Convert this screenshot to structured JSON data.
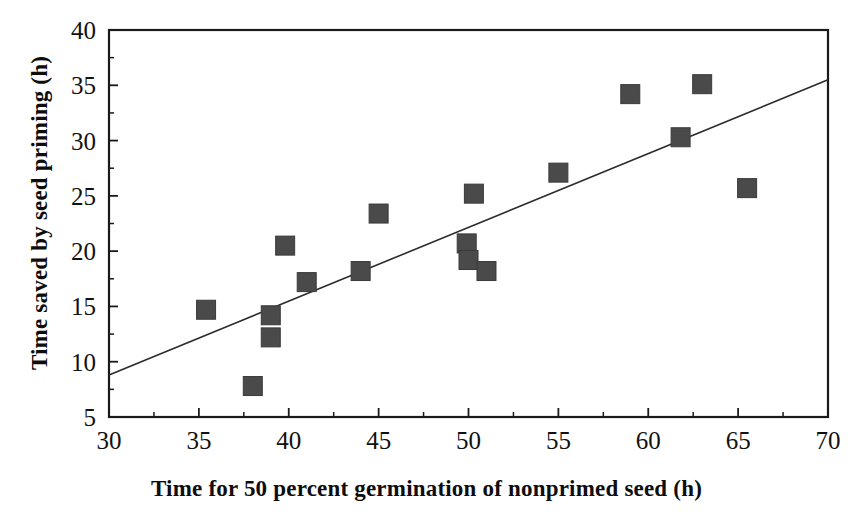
{
  "chart_data": {
    "type": "scatter",
    "title": "",
    "xlabel": "Time for 50 percent germination of nonprimed seed (h)",
    "ylabel": "Time saved by seed priming (h)",
    "xlim": [
      30,
      70
    ],
    "ylim": [
      5,
      40
    ],
    "x_major_ticks": [
      30,
      35,
      40,
      45,
      50,
      55,
      60,
      65,
      70
    ],
    "y_major_ticks": [
      5,
      10,
      15,
      20,
      25,
      30,
      35,
      40
    ],
    "x_minor_ticks": [
      32.5,
      37.5,
      42.5,
      47.5,
      52.5,
      57.5,
      62.5,
      67.5
    ],
    "y_minor_ticks": [
      7.5,
      12.5,
      17.5,
      22.5,
      27.5,
      32.5,
      37.5
    ],
    "x_tick_labels": [
      "30",
      "35",
      "40",
      "45",
      "50",
      "55",
      "60",
      "65",
      "70"
    ],
    "y_tick_labels": [
      "5",
      "10",
      "15",
      "20",
      "25",
      "30",
      "35",
      "40"
    ],
    "grid": false,
    "legend": null,
    "marker": "filled-square",
    "marker_color": "#4a4a4a",
    "frame_color": "#1a1a1a",
    "series": [
      {
        "name": "Seed priming observations",
        "points": [
          {
            "x": 35.4,
            "y": 14.7
          },
          {
            "x": 38.0,
            "y": 7.8
          },
          {
            "x": 39.0,
            "y": 14.2
          },
          {
            "x": 39.0,
            "y": 12.2
          },
          {
            "x": 39.8,
            "y": 20.5
          },
          {
            "x": 41.0,
            "y": 17.2
          },
          {
            "x": 44.0,
            "y": 18.2
          },
          {
            "x": 45.0,
            "y": 23.4
          },
          {
            "x": 49.9,
            "y": 20.7
          },
          {
            "x": 50.0,
            "y": 19.2
          },
          {
            "x": 50.3,
            "y": 25.2
          },
          {
            "x": 51.0,
            "y": 18.2
          },
          {
            "x": 55.0,
            "y": 27.1
          },
          {
            "x": 59.0,
            "y": 34.2
          },
          {
            "x": 61.8,
            "y": 30.3
          },
          {
            "x": 63.0,
            "y": 35.1
          },
          {
            "x": 65.5,
            "y": 25.7
          }
        ]
      }
    ],
    "trendline": {
      "name": "linear fit",
      "x1": 30,
      "y1": 8.8,
      "x2": 70,
      "y2": 35.5,
      "color": "#2b2b2b"
    }
  },
  "axes": {
    "x_title": "Time for 50 percent germination of nonprimed seed (h)",
    "y_title": "Time saved by seed priming (h)"
  }
}
